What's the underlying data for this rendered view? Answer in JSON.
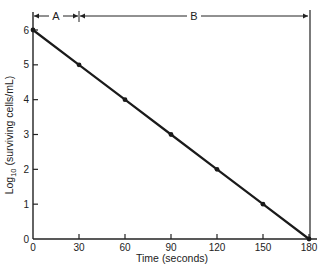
{
  "chart_data": {
    "type": "line",
    "title": "",
    "xlabel": "Time (seconds)",
    "ylabel": "Log10 (surviving cells/mL)",
    "ylabel_parts": {
      "base": "Log",
      "sub": "10",
      "rest": " (surviving cells/mL)"
    },
    "x": [
      0,
      30,
      60,
      90,
      120,
      150,
      180
    ],
    "series": [
      {
        "name": "surviving cells",
        "values": [
          6,
          5,
          4,
          3,
          2,
          1,
          0
        ]
      }
    ],
    "x_ticks": [
      "0",
      "30",
      "60",
      "90",
      "120",
      "150",
      "180"
    ],
    "y_ticks": [
      "0",
      "1",
      "2",
      "3",
      "4",
      "5",
      "6"
    ],
    "xlim": [
      0,
      180
    ],
    "ylim": [
      0,
      6
    ],
    "grid": false,
    "annotations": [
      {
        "label": "A",
        "from": 0,
        "to": 30
      },
      {
        "label": "B",
        "from": 30,
        "to": 180
      }
    ],
    "colors": {
      "line": "#1a1a1a",
      "axis": "#222222"
    }
  }
}
